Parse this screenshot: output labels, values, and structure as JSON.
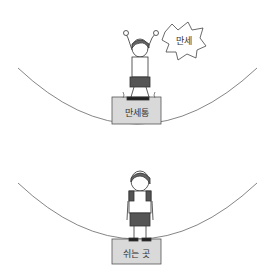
{
  "panels": [
    {
      "name": "cheer-panel",
      "speech_bubble": "만세",
      "box_label": "만세통",
      "pose": "arms raised"
    },
    {
      "name": "rest-panel",
      "box_label": "쉬는 곳",
      "pose": "standing tired"
    }
  ],
  "colors": {
    "box_fill": "#d9d9d9",
    "line": "#555555"
  }
}
